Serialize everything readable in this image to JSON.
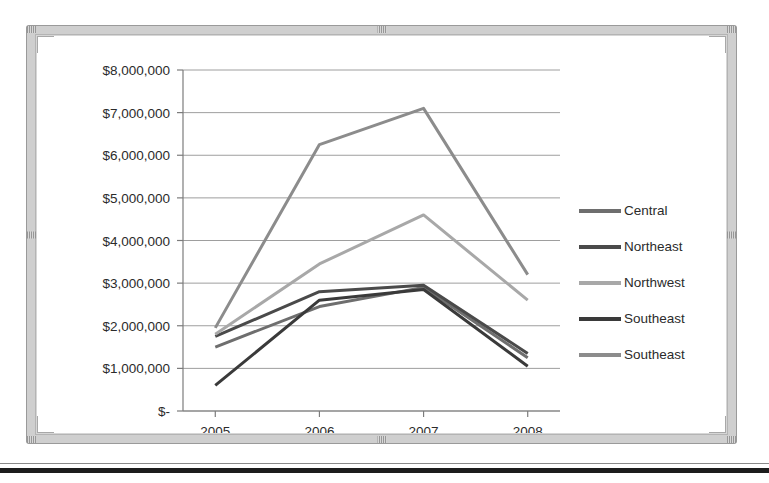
{
  "chart_data": {
    "type": "line",
    "title": "",
    "xlabel": "",
    "ylabel": "",
    "categories": [
      "2005",
      "2006",
      "2007",
      "2008"
    ],
    "x_tick_labels": [
      "2005",
      "2006",
      "2007",
      "2008"
    ],
    "y_tick_labels": [
      "$8,000,000",
      "$7,000,000",
      "$6,000,000",
      "$5,000,000",
      "$4,000,000",
      "$3,000,000",
      "$2,000,000",
      "$1,000,000",
      "$-"
    ],
    "y_tick_values": [
      8000000,
      7000000,
      6000000,
      5000000,
      4000000,
      3000000,
      2000000,
      1000000,
      0
    ],
    "ylim": [
      0,
      8000000
    ],
    "grid": true,
    "legend_position": "right",
    "series": [
      {
        "name": "Central",
        "color": "#6e6e6e",
        "values": [
          1500000,
          2450000,
          2900000,
          1250000
        ]
      },
      {
        "name": "Northeast",
        "color": "#4a4a4a",
        "values": [
          1750000,
          2800000,
          2950000,
          1350000
        ]
      },
      {
        "name": "Northwest",
        "color": "#a8a8a8",
        "values": [
          1800000,
          3450000,
          4600000,
          2600000
        ]
      },
      {
        "name": "Southeast",
        "color": "#3a3a3a",
        "values": [
          600000,
          2600000,
          2850000,
          1050000
        ]
      },
      {
        "name": "Southeast",
        "color": "#8c8c8c",
        "values": [
          1950000,
          6250000,
          7100000,
          3200000
        ]
      }
    ]
  },
  "frame": {
    "selection_grip_name": "selection-handle"
  }
}
